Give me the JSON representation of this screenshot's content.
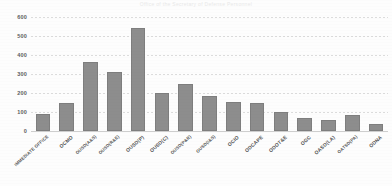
{
  "chart_data": {
    "type": "bar",
    "title": "Office of the Secretary of Defense Personnel",
    "xlabel": "",
    "ylabel": "",
    "ylim": [
      0,
      600
    ],
    "yticks": [
      0,
      100,
      200,
      300,
      400,
      500,
      600
    ],
    "ytick_labels": [
      "0",
      "100",
      "200",
      "300",
      "400",
      "500",
      "600"
    ],
    "grid": true,
    "legend": false,
    "bar_color": "#8d8d8d",
    "categories": [
      "IMMEDIATE OFFICE",
      "OCMO",
      "OUSD(A&S)",
      "OUSD(R&E)",
      "OUSD(P)",
      "OUSD(C)",
      "OUSD(P&R)",
      "OUSD(I&S)",
      "OCIO",
      "ODCAPE",
      "ODOT&E",
      "OGC",
      "OASD(LA)",
      "OATSD(PA)",
      "ODNA"
    ],
    "values": [
      90,
      150,
      365,
      310,
      540,
      200,
      245,
      185,
      155,
      150,
      100,
      70,
      60,
      85,
      35
    ]
  },
  "axis": {
    "y_labels": [
      "600",
      "500",
      "400",
      "300",
      "200",
      "100",
      "0"
    ]
  }
}
